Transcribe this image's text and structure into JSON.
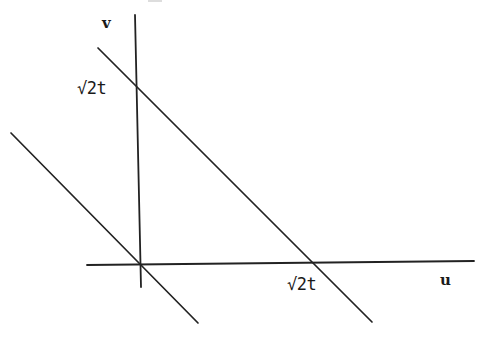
{
  "diagram": {
    "axes": {
      "horizontal_label": "u",
      "vertical_label": "v",
      "horizontal": {
        "x1": 87,
        "y1": 265,
        "x2": 474,
        "y2": 261
      },
      "vertical": {
        "x1": 135,
        "y1": 15,
        "x2": 141,
        "y2": 287
      }
    },
    "lines": [
      {
        "name": "line-through-origin",
        "x1": 11,
        "y1": 133,
        "x2": 198,
        "y2": 323
      },
      {
        "name": "line-intercepts-sqrt2t",
        "x1": 98,
        "y1": 48,
        "x2": 372,
        "y2": 322
      }
    ],
    "labels": {
      "v_intercept": "√2t",
      "u_intercept": "√2t"
    },
    "colors": {
      "stroke": "#222222",
      "background": "#ffffff"
    }
  }
}
